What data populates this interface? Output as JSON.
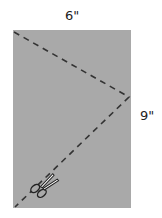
{
  "diagram": {
    "width_label": "6\"",
    "height_label": "9\"",
    "paper_color": "#a9a9a9",
    "fold_line": "dashed",
    "icon": "scissors-icon"
  }
}
